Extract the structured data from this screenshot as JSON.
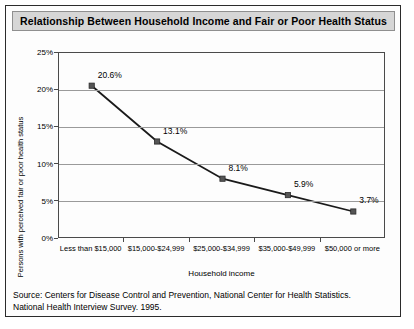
{
  "figure": {
    "title": "Relationship Between Household Income and Fair or Poor Health Status",
    "source_line_1": "Source:  Centers for Disease Control and Prevention, National Center for Health Statistics.",
    "source_line_2": "National Health Interview Survey. 1995."
  },
  "chart_data": {
    "type": "line",
    "title": "Relationship Between Household Income and Fair or Poor Health Status",
    "xlabel": "Household income",
    "ylabel": "Persons with perceived fair or poor health status",
    "categories": [
      "Less than $15,000",
      "$15,000-$24,999",
      "$25,000-$34,999",
      "$35,000-$49,999",
      "$50,000 or more"
    ],
    "values": [
      20.6,
      13.1,
      8.1,
      5.9,
      3.7
    ],
    "point_labels": [
      "20.6%",
      "13.1%",
      "8.1%",
      "5.9%",
      "3.7%"
    ],
    "ylim": [
      0,
      25
    ],
    "yticks": [
      0,
      5,
      10,
      15,
      20,
      25
    ],
    "ytick_labels": [
      "0%",
      "5%",
      "10%",
      "15%",
      "20%",
      "25%"
    ],
    "grid": "horizontal",
    "legend": "none",
    "series_color": "#1a1a1a",
    "marker": "square",
    "marker_color": "#555555"
  }
}
